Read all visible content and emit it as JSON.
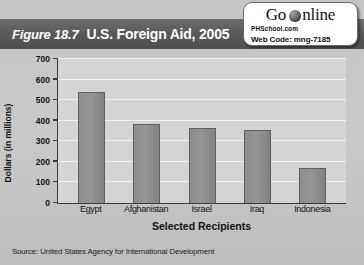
{
  "header": {
    "figure_number": "Figure 18.7",
    "title": "U.S. Foreign Aid, 2005"
  },
  "logo": {
    "go": "Go",
    "online": "nline",
    "globe_icon": "globe-icon",
    "site": "PHSchool.com",
    "web_code": "Web Code: mng-7185"
  },
  "source": {
    "text": "Source:  United States Agency for International Development"
  },
  "colors": {
    "header_band": "#5a5a5a",
    "bar_fill": "#8d8d8d",
    "bar_stroke": "#5f5f5f",
    "plot_background": "#d4d4d4",
    "gridline": "#f2f2f2",
    "axis": "#3a3a3a",
    "card_background": "#c9c9c9"
  },
  "chart_data": {
    "type": "bar",
    "title": "U.S. Foreign Aid, 2005",
    "categories": [
      "Egypt",
      "Afghanistan",
      "Israel",
      "Iraq",
      "Indonesia"
    ],
    "values": [
      540,
      385,
      365,
      355,
      170
    ],
    "xlabel": "Selected Recipients",
    "ylabel": "Dollars (in millions)",
    "ylim": [
      0,
      700
    ],
    "yticks": [
      0,
      100,
      200,
      300,
      400,
      500,
      600,
      700
    ],
    "ytick_labels": [
      "0",
      "100",
      "200",
      "300",
      "400",
      "500",
      "600",
      "700"
    ],
    "grid": true,
    "legend": false,
    "source": "United States Agency for International Development"
  }
}
